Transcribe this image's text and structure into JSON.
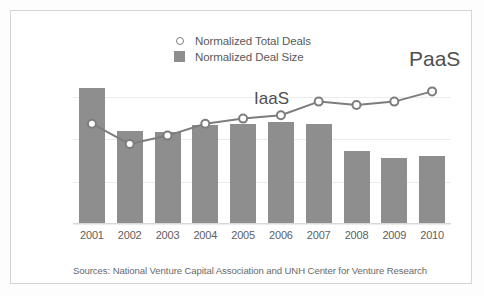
{
  "chart_data": {
    "type": "bar",
    "title": "",
    "subtitle": "",
    "xlabel": "",
    "ylabel": "",
    "categories": [
      "2001",
      "2002",
      "2003",
      "2004",
      "2005",
      "2006",
      "2007",
      "2008",
      "2009",
      "2010"
    ],
    "ylim": [
      0,
      100
    ],
    "grid": true,
    "gridlines": [
      0,
      25,
      50,
      75,
      100
    ],
    "legend_position": "top-center",
    "series": [
      {
        "name": "Normalized Total Deals",
        "type": "line",
        "marker": "open-circle",
        "color": "#7d7d7d",
        "values": [
          59,
          47,
          52,
          59,
          62,
          64,
          72,
          70,
          72,
          78
        ]
      },
      {
        "name": "Normalized Deal Size",
        "type": "bar",
        "color": "#8e8e8e",
        "values": [
          80,
          55,
          54,
          58,
          59,
          60,
          59,
          43,
          39,
          40
        ]
      }
    ],
    "annotations": [
      {
        "text": "IaaS",
        "x": "2006",
        "y": 70
      },
      {
        "text": "PaaS",
        "x": "2010",
        "y": 95
      }
    ],
    "source": "Sources: National Venture Capital Association and UNH Center for Venture Research"
  },
  "legend": {
    "items": [
      {
        "label": "Normalized Total Deals",
        "marker": "open-circle",
        "color": "#7d7d7d"
      },
      {
        "label": "Normalized Deal Size",
        "marker": "filled-square",
        "color": "#8e8e8e"
      }
    ]
  },
  "annotations": {
    "iaas": "IaaS",
    "paas": "PaaS"
  },
  "footer": {
    "source": "Sources: National Venture Capital Association and UNH Center for Venture Research"
  },
  "colors": {
    "bar": "#8e8e8e",
    "line": "#7d7d7d",
    "grid": "#ececec",
    "axis": "#d8d8d8",
    "frame": "#d4d4d4",
    "text": "#5a5a5a",
    "background": "#ffffff"
  }
}
